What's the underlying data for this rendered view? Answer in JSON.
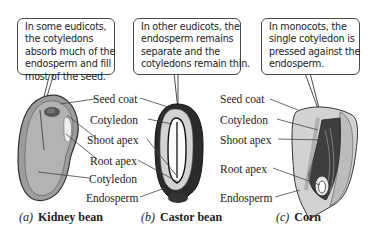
{
  "figure": {
    "panels": [
      {
        "id": "a",
        "caption_letter": "(a)",
        "caption_name": "Kidney bean",
        "callout_lines": [
          "In some eudicots,",
          "the cotyledons",
          "absorb much of the",
          "endosperm and fill",
          "most of the seed."
        ]
      },
      {
        "id": "b",
        "caption_letter": "(b)",
        "caption_name": "Castor bean",
        "callout_lines": [
          "In other eudicots, the",
          "endosperm remains",
          "separate and the",
          "cotyledons remain thin."
        ]
      },
      {
        "id": "c",
        "caption_letter": "(c)",
        "caption_name": "Corn",
        "callout_lines": [
          "In monocots, the",
          "single cotyledon is",
          "pressed against the",
          "endosperm."
        ]
      }
    ],
    "labels_ab": {
      "seed_coat": "Seed coat",
      "cotyledon_top": "Cotyledon",
      "shoot_apex": "Shoot apex",
      "root_apex": "Root apex",
      "cotyledon_bottom": "Cotyledon",
      "endosperm": "Endosperm"
    },
    "labels_c": {
      "seed_coat": "Seed coat",
      "cotyledon": "Cotyledon",
      "shoot_apex": "Shoot apex",
      "root_apex": "Root apex",
      "endosperm": "Endosperm"
    },
    "colors": {
      "seed_fill": "#a9a9a9",
      "seed_outline": "#3a3a3a",
      "castor_dark": "#2b2b2b",
      "castor_endosperm": "#d4d4d4",
      "corn_endosperm": "#cfcfcf",
      "leader_line": "#444444"
    }
  }
}
